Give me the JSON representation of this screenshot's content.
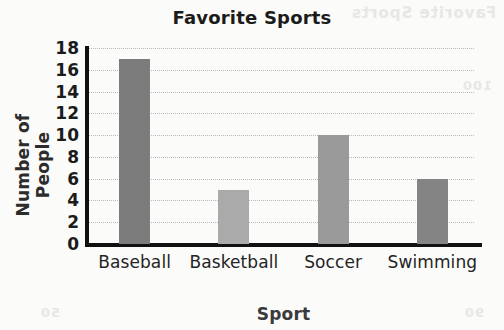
{
  "chart_data": {
    "type": "bar",
    "title": "Favorite Sports",
    "xlabel": "Sport",
    "ylabel": "Number of People",
    "categories": [
      "Baseball",
      "Basketball",
      "Soccer",
      "Swimming"
    ],
    "values": [
      17,
      5,
      10,
      6
    ],
    "ylim": [
      0,
      18
    ],
    "ytick_labels": [
      "0",
      "2",
      "4",
      "6",
      "8",
      "10",
      "12",
      "14",
      "16",
      "18"
    ],
    "ytick_values": [
      0,
      2,
      4,
      6,
      8,
      10,
      12,
      14,
      16,
      18
    ],
    "grid": "horizontal-dotted",
    "legend": "none",
    "bar_colors": [
      "#7c7c7c",
      "#aaaaaa",
      "#9a9a9a",
      "#848484"
    ],
    "axis_color": "#111111",
    "gridline_color": "#b9b9b9",
    "background_color": "#fbfbfa"
  },
  "background_artifacts": {
    "top_right": "Favorite Sports",
    "middle_right": "100",
    "bottom_right": "90",
    "bottom_left": "50"
  }
}
